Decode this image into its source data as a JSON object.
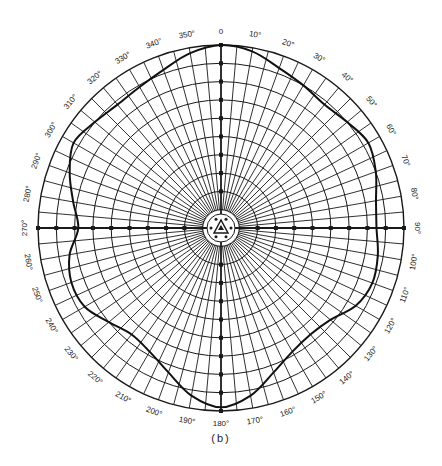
{
  "caption": "(b)",
  "chart_data": {
    "type": "polar",
    "title": "",
    "caption": "(b)",
    "angle_direction": "clockwise",
    "zero_location": "top",
    "angle_tick_labels": [
      "0",
      "10°",
      "20°",
      "30°",
      "40°",
      "50°",
      "60°",
      "70°",
      "80°",
      "90°",
      "100°",
      "110°",
      "120°",
      "130°",
      "140°",
      "150°",
      "160°",
      "170°",
      "180°",
      "190°",
      "200°",
      "210°",
      "220°",
      "230°",
      "240°",
      "250°",
      "260°",
      "270°",
      "280°",
      "290°",
      "300°",
      "310°",
      "320°",
      "330°",
      "340°",
      "350°"
    ],
    "radial_rings": 10,
    "rlim": [
      0,
      1
    ],
    "grid": true,
    "series": [
      {
        "name": "radiation pattern",
        "theta": [
          0,
          10,
          20,
          30,
          40,
          50,
          60,
          70,
          80,
          90,
          100,
          110,
          120,
          130,
          140,
          150,
          160,
          170,
          180,
          190,
          200,
          210,
          220,
          230,
          240,
          250,
          260,
          270,
          280,
          290,
          300,
          310,
          320,
          330,
          340,
          350
        ],
        "r": [
          1.0,
          0.98,
          0.93,
          0.9,
          0.88,
          0.9,
          0.93,
          0.9,
          0.86,
          0.85,
          0.87,
          0.88,
          0.85,
          0.78,
          0.76,
          0.78,
          0.84,
          0.93,
          0.98,
          0.93,
          0.84,
          0.78,
          0.76,
          0.8,
          0.86,
          0.87,
          0.84,
          0.78,
          0.82,
          0.88,
          0.93,
          0.9,
          0.88,
          0.89,
          0.92,
          0.97
        ]
      }
    ]
  },
  "colors": {
    "grid": "#1a1a1a",
    "curve": "#111111",
    "background": "#ffffff"
  }
}
